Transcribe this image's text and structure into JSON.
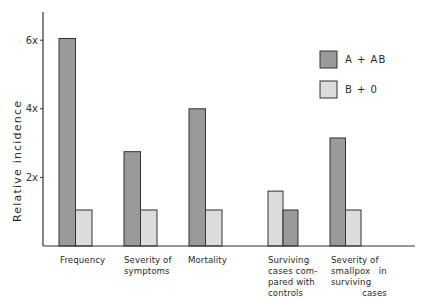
{
  "chart_data": {
    "type": "bar",
    "title": "",
    "xlabel": "",
    "ylabel": "Relative incidence",
    "ylim": [
      0,
      6.8
    ],
    "yticks": [
      {
        "value": 2,
        "label": "2x"
      },
      {
        "value": 4,
        "label": "4x"
      },
      {
        "value": 6,
        "label": "6x"
      }
    ],
    "grid": false,
    "legend_position": "upper right",
    "categories": [
      "Frequency",
      "Severity of symptoms",
      "Mortality",
      "Surviving cases compared with controls",
      "Severity of smallpox in surviving cases"
    ],
    "category_labels_display": [
      "Frequency",
      "Severity of\nsymptoms",
      "Mortality",
      "Surviving\ncases com-\npared with\ncontrols",
      "Severity of\nsmallpox   in\nsurviving\n           cases"
    ],
    "series": [
      {
        "name": "A + AB",
        "color": "#9a9a9a",
        "values": [
          6.05,
          2.75,
          4.0,
          1.05,
          3.15
        ]
      },
      {
        "name": "B + 0",
        "color": "#dcdcdc",
        "values": [
          1.05,
          1.05,
          1.05,
          1.6,
          1.05
        ]
      }
    ],
    "bar_order_note": "In 'Surviving cases compared with controls' the light (B + 0) bar is drawn left of the dark (A + AB) bar."
  },
  "legend": {
    "items": [
      {
        "label": "A + AB",
        "color": "#9a9a9a"
      },
      {
        "label": "B + 0",
        "color": "#dcdcdc"
      }
    ]
  },
  "axis": {
    "ylabel": "Relative incidence",
    "ticks": [
      "2x",
      "4x",
      "6x"
    ]
  }
}
